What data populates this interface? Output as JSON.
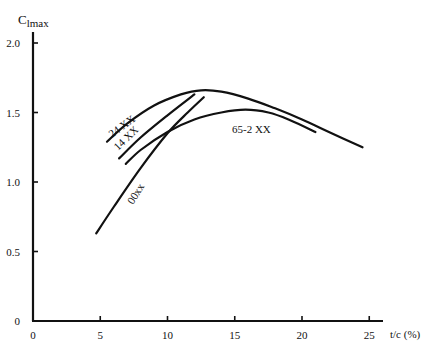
{
  "chart_data": {
    "type": "line",
    "title": "",
    "xlabel": "t/c (%)",
    "ylabel": "Clmax",
    "ylabel_main": "C",
    "ylabel_sub": "lmax",
    "xlim": [
      0,
      26
    ],
    "ylim": [
      0,
      2.1
    ],
    "xticks": [
      0,
      5,
      10,
      15,
      20,
      25
    ],
    "xtick_labels": [
      "0",
      "5",
      "10",
      "15",
      "20",
      "25"
    ],
    "yticks": [
      0,
      0.5,
      1.0,
      1.5,
      2.0
    ],
    "ytick_labels": [
      "0",
      "0.5",
      "1.0",
      "1.5",
      "2.0"
    ],
    "grid": false,
    "legend": "inline labels",
    "series": [
      {
        "name": "24 XX",
        "label": "24 XX",
        "x": [
          5.5,
          7,
          9,
          11,
          12.5,
          14,
          16,
          18,
          20,
          22,
          24.5
        ],
        "y": [
          1.29,
          1.42,
          1.55,
          1.63,
          1.66,
          1.65,
          1.6,
          1.53,
          1.45,
          1.36,
          1.25
        ]
      },
      {
        "name": "14 XX",
        "label": "14 XX",
        "x": [
          6.4,
          8,
          10,
          12
        ],
        "y": [
          1.17,
          1.32,
          1.48,
          1.63
        ]
      },
      {
        "name": "65-2 XX",
        "label": "65-2 XX",
        "x": [
          6.9,
          8,
          10,
          12,
          14,
          15.8,
          17.5,
          19,
          21
        ],
        "y": [
          1.13,
          1.23,
          1.36,
          1.45,
          1.5,
          1.52,
          1.5,
          1.45,
          1.36
        ]
      },
      {
        "name": "00xx",
        "label": "00xx",
        "x": [
          4.7,
          6,
          8,
          10,
          11.5,
          12.7
        ],
        "y": [
          0.63,
          0.82,
          1.1,
          1.35,
          1.5,
          1.61
        ]
      }
    ]
  }
}
